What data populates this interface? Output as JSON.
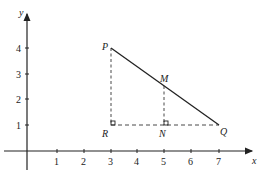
{
  "diagram": {
    "axes": {
      "x_label": "x",
      "y_label": "y",
      "x_ticks": [
        "1",
        "2",
        "3",
        "4",
        "5",
        "6",
        "7"
      ],
      "y_ticks": [
        "1",
        "2",
        "3",
        "4"
      ]
    },
    "points": {
      "P": {
        "label": "P",
        "x": 3,
        "y": 4
      },
      "Q": {
        "label": "Q",
        "x": 7,
        "y": 1
      },
      "R": {
        "label": "R",
        "x": 3,
        "y": 1
      },
      "M": {
        "label": "M",
        "x": 5,
        "y": 2.5
      },
      "N": {
        "label": "N",
        "x": 5,
        "y": 1
      }
    },
    "segments": [
      {
        "from": "P",
        "to": "Q",
        "style": "solid"
      },
      {
        "from": "P",
        "to": "R",
        "style": "dashed"
      },
      {
        "from": "R",
        "to": "Q",
        "style": "dashed"
      },
      {
        "from": "M",
        "to": "N",
        "style": "dashed"
      }
    ],
    "right_angles": [
      "R",
      "N"
    ],
    "colors": {
      "ink": "#222222",
      "background": "#ffffff"
    }
  }
}
